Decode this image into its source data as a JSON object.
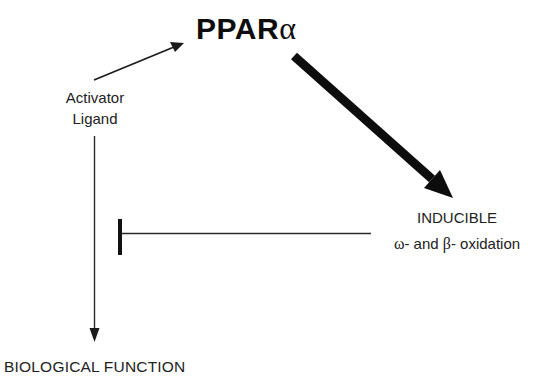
{
  "diagram": {
    "nodes": {
      "ppar": {
        "label_main": "PPAR",
        "label_greek": "α"
      },
      "activator_ligand": {
        "line1": "Activator",
        "line2": "Ligand"
      },
      "inducible_oxidation": {
        "line1": "INDUCIBLE",
        "omega": "ω",
        "mid": "- and ",
        "beta": "β",
        "tail": "- oxidation"
      },
      "biological_function": {
        "label": "BIOLOGICAL FUNCTION"
      }
    },
    "edges": [
      {
        "from": "Activator Ligand",
        "to": "PPARα",
        "type": "activation",
        "weight": "thin"
      },
      {
        "from": "PPARα",
        "to": "INDUCIBLE ω- and β- oxidation",
        "type": "activation",
        "weight": "thick"
      },
      {
        "from": "Activator Ligand",
        "to": "BIOLOGICAL FUNCTION",
        "type": "activation",
        "weight": "thin"
      },
      {
        "from": "INDUCIBLE ω- and β- oxidation",
        "to": "Activator Ligand → BIOLOGICAL FUNCTION",
        "type": "inhibition",
        "weight": "thin"
      }
    ],
    "colors": {
      "line": "#1a1a1a",
      "background": "#ffffff"
    }
  }
}
